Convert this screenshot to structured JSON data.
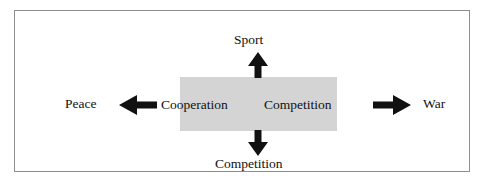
{
  "diagram": {
    "frame": {
      "border_color": "#8e8e8e"
    },
    "center_box": {
      "fill_color": "#d4d4d4",
      "left_label": "Cooperation",
      "right_label": "Competition"
    },
    "poles": {
      "left_label": "Peace",
      "right_label": "War",
      "top_label": "Sport",
      "bottom_label": "Competition"
    },
    "arrows": [
      {
        "direction": "up",
        "name": "arrow-up",
        "points_to": "Sport"
      },
      {
        "direction": "down",
        "name": "arrow-down",
        "points_to": "Competition"
      },
      {
        "direction": "left",
        "name": "arrow-left",
        "points_to": "Peace"
      },
      {
        "direction": "right",
        "name": "arrow-right",
        "points_to": "War"
      }
    ],
    "arrow_color": "#111111",
    "text_color": "#111111"
  }
}
